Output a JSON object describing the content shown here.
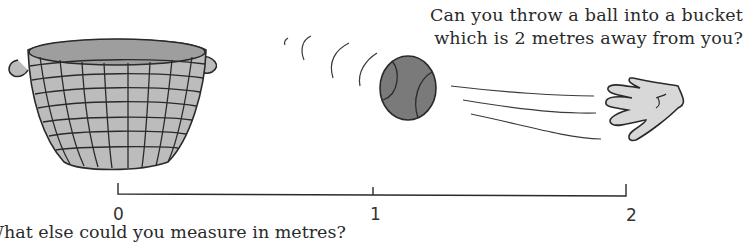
{
  "question": {
    "line1": "Can you throw a ball into a bucket",
    "line2": "which is 2 metres away from you?"
  },
  "scale": {
    "unit": "metres",
    "ticks": [
      {
        "label": "0",
        "x": 118
      },
      {
        "label": "1",
        "x": 373
      },
      {
        "label": "2",
        "x": 626
      }
    ]
  },
  "footer": {
    "text": "What else could you measure in metres?"
  },
  "illustration": {
    "items": [
      "basket-bucket",
      "ball",
      "hand"
    ],
    "colors": {
      "basket": "#b8b8b8",
      "ball": "#7a7a7a",
      "hand": "#d8d8d8",
      "line": "#2a2a2a"
    }
  }
}
